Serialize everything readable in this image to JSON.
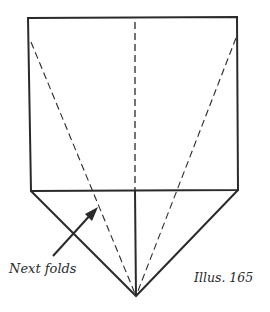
{
  "diagram": {
    "type": "origami-fold-instruction",
    "labels": {
      "next_folds": "Next folds",
      "illustration": "Illus. 165"
    },
    "colors": {
      "line": "#2a2a2a",
      "background": "#ffffff"
    },
    "shapes": {
      "rectangle": {
        "top_left": [
          28,
          18
        ],
        "top_right": [
          237,
          17
        ],
        "bottom_right": [
          238,
          190
        ],
        "bottom_left": [
          31,
          191
        ]
      },
      "bottom_point": [
        136,
        296
      ],
      "valley_folds_dashed": [
        {
          "name": "left-diagonal",
          "from": [
            31,
            42
          ],
          "to": [
            136,
            296
          ]
        },
        {
          "name": "right-diagonal",
          "from": [
            236,
            38
          ],
          "to": [
            136,
            296
          ]
        },
        {
          "name": "center-vertical",
          "from": [
            135,
            22
          ],
          "to": [
            135,
            190
          ]
        }
      ],
      "solid_center": {
        "from": [
          135,
          190
        ],
        "to": [
          136,
          296
        ]
      },
      "arrow": {
        "from": [
          53,
          256
        ],
        "to": [
          97,
          208
        ]
      }
    }
  }
}
